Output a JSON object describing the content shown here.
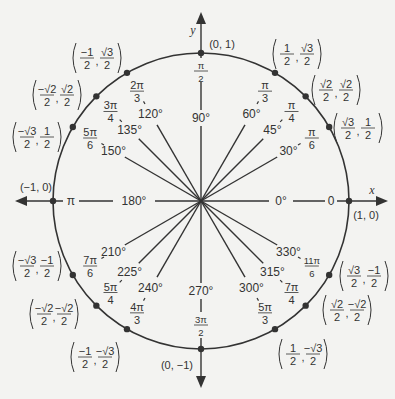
{
  "diagram": {
    "center": [
      201,
      201
    ],
    "radius": 148,
    "colors": {
      "line": "#333333",
      "background": "#f3f3f1"
    },
    "axes": {
      "x_label": "x",
      "y_label": "y",
      "x_left": 15,
      "x_right": 388,
      "y_top": 12,
      "y_bottom": 388
    },
    "axis_points": [
      {
        "angle_deg": 0,
        "coord": "(1, 0)",
        "radian": "0",
        "degree": "0°"
      },
      {
        "angle_deg": 90,
        "coord": "(0, 1)",
        "radian_num": "π",
        "radian_den": "2",
        "degree": "90°"
      },
      {
        "angle_deg": 180,
        "coord": "(−1, 0)",
        "radian": "π",
        "degree": "180°"
      },
      {
        "angle_deg": 270,
        "coord": "(0, −1)",
        "radian_num": "3π",
        "radian_den": "2",
        "degree": "270°"
      }
    ],
    "points": [
      {
        "angle_deg": 30,
        "degree": "30°",
        "rad_num": "π",
        "rad_den": "6",
        "x_num": "√3",
        "x_den": "2",
        "y_num": "1",
        "y_den": "2",
        "coord_pos": [
          358,
          128
        ]
      },
      {
        "angle_deg": 45,
        "degree": "45°",
        "rad_num": "π",
        "rad_den": "4",
        "x_num": "√2",
        "x_den": "2",
        "y_num": "√2",
        "y_den": "2",
        "coord_pos": [
          336,
          90
        ]
      },
      {
        "angle_deg": 60,
        "degree": "60°",
        "rad_num": "π",
        "rad_den": "3",
        "x_num": "1",
        "x_den": "2",
        "y_num": "√3",
        "y_den": "2",
        "coord_pos": [
          297,
          54
        ]
      },
      {
        "angle_deg": 120,
        "degree": "120°",
        "rad_num": "2π",
        "rad_den": "3",
        "x_num": "−1",
        "x_den": "2",
        "y_num": "√3",
        "y_den": "2",
        "coord_pos": [
          97,
          58
        ]
      },
      {
        "angle_deg": 135,
        "degree": "135°",
        "rad_num": "3π",
        "rad_den": "4",
        "x_num": "−√2",
        "x_den": "2",
        "y_num": "√2",
        "y_den": "2",
        "coord_pos": [
          57,
          95
        ]
      },
      {
        "angle_deg": 150,
        "degree": "150°",
        "rad_num": "5π",
        "rad_den": "6",
        "x_num": "−√3",
        "x_den": "2",
        "y_num": "1",
        "y_den": "2",
        "coord_pos": [
          37,
          137
        ]
      },
      {
        "angle_deg": 210,
        "degree": "210°",
        "rad_num": "7π",
        "rad_den": "6",
        "x_num": "−√3",
        "x_den": "2",
        "y_num": "−1",
        "y_den": "2",
        "coord_pos": [
          37,
          266
        ]
      },
      {
        "angle_deg": 225,
        "degree": "225°",
        "rad_num": "5π",
        "rad_den": "4",
        "x_num": "−√2",
        "x_den": "2",
        "y_num": "−√2",
        "y_den": "2",
        "coord_pos": [
          54,
          314
        ]
      },
      {
        "angle_deg": 240,
        "degree": "240°",
        "rad_num": "4π",
        "rad_den": "3",
        "x_num": "−1",
        "x_den": "2",
        "y_num": "−√3",
        "y_den": "2",
        "coord_pos": [
          95,
          357
        ]
      },
      {
        "angle_deg": 300,
        "degree": "300°",
        "rad_num": "5π",
        "rad_den": "3",
        "x_num": "1",
        "x_den": "2",
        "y_num": "−√3",
        "y_den": "2",
        "coord_pos": [
          303,
          354
        ]
      },
      {
        "angle_deg": 315,
        "degree": "315°",
        "rad_num": "7π",
        "rad_den": "4",
        "x_num": "√2",
        "x_den": "2",
        "y_num": "−√2",
        "y_den": "2",
        "coord_pos": [
          347,
          310
        ]
      },
      {
        "angle_deg": 330,
        "degree": "330°",
        "rad_num": "11π",
        "rad_den": "6",
        "x_num": "√3",
        "x_den": "2",
        "y_num": "−1",
        "y_den": "2",
        "coord_pos": [
          364,
          276
        ]
      }
    ]
  }
}
